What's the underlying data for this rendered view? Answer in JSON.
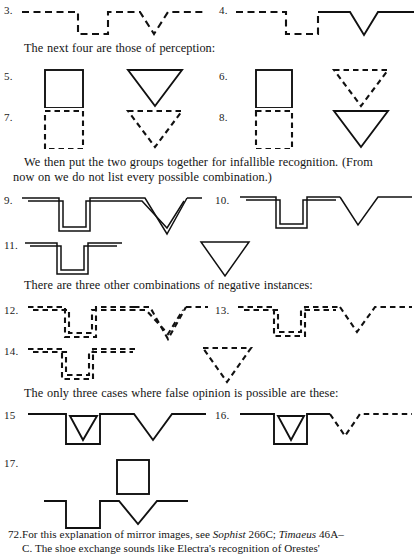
{
  "page": {
    "width": 418,
    "height": 558,
    "background": "#ffffff",
    "ink_color": "#111111"
  },
  "figures": [
    {
      "num": "3.",
      "label_x": 4,
      "label_y": 4
    },
    {
      "num": "4.",
      "label_x": 219,
      "label_y": 4
    },
    {
      "num": "5.",
      "label_x": 4,
      "label_y": 70
    },
    {
      "num": "6.",
      "label_x": 219,
      "label_y": 70
    },
    {
      "num": "7.",
      "label_x": 4,
      "label_y": 111
    },
    {
      "num": "8.",
      "label_x": 219,
      "label_y": 111
    },
    {
      "num": "9.",
      "label_x": 4,
      "label_y": 194
    },
    {
      "num": "10.",
      "label_x": 215,
      "label_y": 194
    },
    {
      "num": "11.",
      "label_x": 4,
      "label_y": 239
    },
    {
      "num": "12.",
      "label_x": 4,
      "label_y": 304
    },
    {
      "num": "13.",
      "label_x": 215,
      "label_y": 304
    },
    {
      "num": "14.",
      "label_x": 4,
      "label_y": 345
    },
    {
      "num": "15",
      "label_x": 4,
      "label_y": 409
    },
    {
      "num": "16.",
      "label_x": 215,
      "label_y": 409
    },
    {
      "num": "17.",
      "label_x": 4,
      "label_y": 457
    }
  ],
  "paragraphs": {
    "perception": "The next four are those of perception:",
    "infallible_line1": "We then put the two groups together for infallible recognition. (From",
    "infallible_line2": "now on we do not list every possible combination.)",
    "negative": "There are three other combinations of negative instances:",
    "false_opinion": "The only three cases where false opinion is possible are these:"
  },
  "footnote": {
    "marker": "72.",
    "line1_a": "For this explanation of mirror images, see ",
    "line1_ital1": "Sophist",
    "line1_b": " 266C; ",
    "line1_ital2": "Timaeus",
    "line1_c": " 46A–",
    "line2": "C. The shoe exchange sounds like Electra's recognition of Orestes'"
  }
}
